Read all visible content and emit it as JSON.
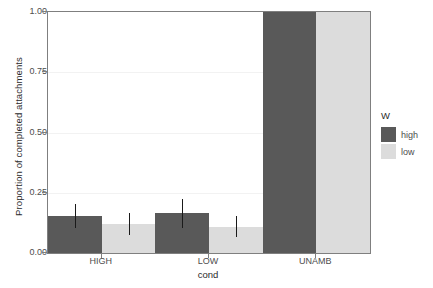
{
  "chart_data": {
    "type": "bar",
    "title": "",
    "subtitle": "",
    "xlabel": "cond",
    "ylabel": "Proportion of completed attachments",
    "categories": [
      "HIGH",
      "LOW",
      "UNAMB"
    ],
    "ylim": [
      0.0,
      1.0
    ],
    "yticks": [
      "0.00",
      "0.25",
      "0.50",
      "0.75",
      "1.00"
    ],
    "ytick_values": [
      0.0,
      0.25,
      0.5,
      0.75,
      1.0
    ],
    "grid": true,
    "grid_axis": "y",
    "legend_title": "W",
    "legend_position": "right",
    "series": [
      {
        "name": "high",
        "color": "#595959",
        "values": [
          0.155,
          0.165,
          1.0
        ],
        "errors_low": [
          0.105,
          0.105,
          null
        ],
        "errors_high": [
          0.205,
          0.225,
          null
        ]
      },
      {
        "name": "low",
        "color": "#dcdcdc",
        "values": [
          0.12,
          0.11,
          1.0
        ],
        "errors_low": [
          0.075,
          0.065,
          null
        ],
        "errors_high": [
          0.165,
          0.155,
          null
        ]
      }
    ]
  },
  "axis": {
    "y_title": "Proportion of completed attachments",
    "x_title": "cond",
    "y_ticks": [
      "0.00",
      "0.25",
      "0.50",
      "0.75",
      "1.00"
    ],
    "x_ticks": [
      "HIGH",
      "LOW",
      "UNAMB"
    ]
  },
  "legend": {
    "title": "W",
    "items": [
      {
        "label": "high",
        "color": "#595959"
      },
      {
        "label": "low",
        "color": "#dcdcdc"
      }
    ]
  },
  "colors": {
    "panel_border": "#7f7f7f",
    "gridline": "#f2f2f2",
    "background": "#ffffff",
    "errorbar": "#1a1a1a",
    "high": "#595959",
    "low": "#dcdcdc"
  }
}
